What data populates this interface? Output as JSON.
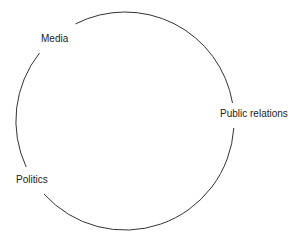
{
  "diagram": {
    "type": "cycle",
    "nodes": [
      {
        "id": "media",
        "label": "Media"
      },
      {
        "id": "public-relations",
        "label": "Public relations"
      },
      {
        "id": "politics",
        "label": "Politics"
      }
    ],
    "line_color": "#333333",
    "text_color": "#222222"
  }
}
